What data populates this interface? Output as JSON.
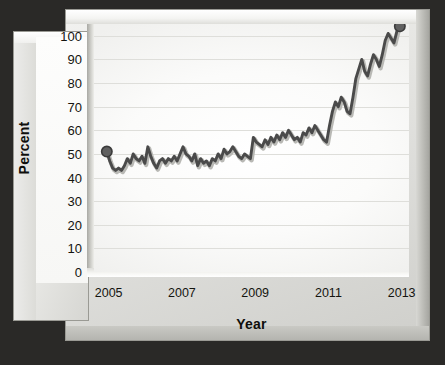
{
  "chart_data": {
    "type": "line",
    "title": "",
    "xlabel": "Year",
    "ylabel": "Percent",
    "xlim": [
      2004.6,
      2013.2
    ],
    "ylim": [
      0,
      105
    ],
    "grid": true,
    "legend": null,
    "y_ticks": [
      100,
      90,
      80,
      70,
      60,
      50,
      40,
      30,
      20,
      10,
      0
    ],
    "x_ticks": [
      2005,
      2007,
      2009,
      2011,
      2013
    ],
    "x_tick_labels": [
      "2005",
      "2007",
      "2009",
      "2011",
      "2013"
    ],
    "line_color": "#4a4a4a",
    "marker_color": "#606060",
    "markers_at": [
      "first",
      "last"
    ],
    "series": [
      {
        "name": "Percent",
        "x": [
          2004.95,
          2005.03,
          2005.11,
          2005.19,
          2005.27,
          2005.35,
          2005.43,
          2005.51,
          2005.59,
          2005.67,
          2005.75,
          2005.83,
          2005.91,
          2005.99,
          2006.07,
          2006.15,
          2006.23,
          2006.31,
          2006.39,
          2006.47,
          2006.55,
          2006.63,
          2006.71,
          2006.79,
          2006.87,
          2006.95,
          2007.03,
          2007.11,
          2007.19,
          2007.27,
          2007.35,
          2007.43,
          2007.51,
          2007.59,
          2007.67,
          2007.75,
          2007.83,
          2007.91,
          2007.99,
          2008.07,
          2008.15,
          2008.23,
          2008.31,
          2008.39,
          2008.47,
          2008.55,
          2008.63,
          2008.71,
          2008.79,
          2008.87,
          2008.95,
          2009.03,
          2009.11,
          2009.19,
          2009.27,
          2009.35,
          2009.43,
          2009.51,
          2009.59,
          2009.67,
          2009.75,
          2009.83,
          2009.91,
          2009.99,
          2010.07,
          2010.15,
          2010.23,
          2010.31,
          2010.39,
          2010.47,
          2010.55,
          2010.63,
          2010.71,
          2010.79,
          2010.87,
          2010.95,
          2011.03,
          2011.11,
          2011.19,
          2011.27,
          2011.35,
          2011.43,
          2011.51,
          2011.59,
          2011.67,
          2011.75,
          2011.83,
          2011.91,
          2011.99,
          2012.07,
          2012.15,
          2012.23,
          2012.31,
          2012.39,
          2012.47,
          2012.55,
          2012.63,
          2012.71,
          2012.79,
          2012.87,
          2012.95
        ],
        "values": [
          51,
          47,
          44,
          43,
          44,
          43,
          45,
          48,
          46,
          50,
          48,
          47,
          49,
          46,
          53,
          49,
          46,
          44,
          47,
          48,
          46,
          48,
          47,
          49,
          47,
          50,
          53,
          50,
          49,
          47,
          50,
          45,
          48,
          46,
          47,
          45,
          48,
          47,
          50,
          48,
          52,
          50,
          51,
          53,
          51,
          49,
          48,
          50,
          49,
          48,
          57,
          55,
          54,
          53,
          56,
          54,
          57,
          55,
          58,
          56,
          59,
          57,
          60,
          58,
          56,
          57,
          55,
          59,
          58,
          61,
          59,
          62,
          60,
          58,
          56,
          55,
          62,
          68,
          72,
          70,
          74,
          72,
          68,
          67,
          74,
          82,
          86,
          90,
          85,
          83,
          88,
          92,
          90,
          87,
          92,
          98,
          101,
          99,
          97,
          102,
          104
        ]
      }
    ]
  },
  "axis": {
    "y_title": "Percent",
    "x_title": "Year"
  }
}
